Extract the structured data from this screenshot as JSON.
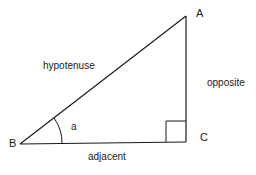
{
  "diagram": {
    "type": "right-triangle",
    "vertices": {
      "A": {
        "label": "A"
      },
      "B": {
        "label": "B"
      },
      "C": {
        "label": "C"
      }
    },
    "sides": {
      "hypotenuse": {
        "label": "hypotenuse"
      },
      "opposite": {
        "label": "opposite"
      },
      "adjacent": {
        "label": "adjacent"
      }
    },
    "angle": {
      "label": "a"
    },
    "colors": {
      "stroke": "#1a1a1a",
      "background": "#ffffff"
    }
  }
}
